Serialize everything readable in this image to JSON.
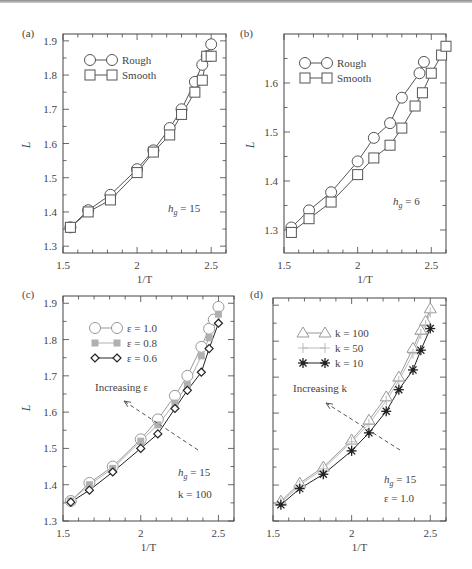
{
  "chart_data": [
    {
      "panel": "(a)",
      "type": "line",
      "xlabel": "1/T",
      "ylabel": "L",
      "xlim": [
        1.5,
        2.6
      ],
      "ylim": [
        1.28,
        1.92
      ],
      "xticks": [
        1.5,
        2,
        2.5
      ],
      "xtick_labels": [
        "1.5",
        "2",
        "2.5"
      ],
      "yticks": [
        1.3,
        1.4,
        1.5,
        1.6,
        1.7,
        1.8,
        1.9
      ],
      "ytick_labels": [
        "1.3",
        "1.4",
        "1.5",
        "1.6",
        "1.7",
        "1.8",
        "1.9"
      ],
      "legend_position": "upper left",
      "annotations": [
        {
          "text": "h_g = 15"
        }
      ],
      "series": [
        {
          "name": "Rough",
          "marker": "circle",
          "color": "#555555",
          "x": [
            1.55,
            1.67,
            1.82,
            2.0,
            2.11,
            2.22,
            2.3,
            2.39,
            2.44,
            2.47,
            2.5
          ],
          "y": [
            1.355,
            1.405,
            1.45,
            1.525,
            1.58,
            1.645,
            1.7,
            1.78,
            1.83,
            1.855,
            1.89
          ]
        },
        {
          "name": "Smooth",
          "marker": "square",
          "color": "#555555",
          "x": [
            1.55,
            1.67,
            1.82,
            2.0,
            2.11,
            2.22,
            2.3,
            2.39,
            2.44,
            2.47,
            2.5
          ],
          "y": [
            1.355,
            1.4,
            1.435,
            1.515,
            1.575,
            1.625,
            1.685,
            1.75,
            1.785,
            1.855,
            1.855
          ]
        }
      ]
    },
    {
      "panel": "(b)",
      "type": "line",
      "xlabel": "1/T",
      "ylabel": "L",
      "xlim": [
        1.5,
        2.6
      ],
      "ylim": [
        1.253,
        1.7
      ],
      "xticks": [
        1.5,
        2,
        2.5
      ],
      "xtick_labels": [
        "1.5",
        "2",
        "2.5"
      ],
      "yticks": [
        1.3,
        1.4,
        1.5,
        1.6
      ],
      "ytick_labels": [
        "1.3",
        "1.4",
        "1.5",
        "1.6"
      ],
      "legend_position": "upper left",
      "annotations": [
        {
          "text": "h_g = 6"
        }
      ],
      "series": [
        {
          "name": "Rough",
          "marker": "circle",
          "color": "#555555",
          "x": [
            1.55,
            1.67,
            1.82,
            2.0,
            2.11,
            2.22,
            2.3,
            2.42,
            2.45
          ],
          "y": [
            1.305,
            1.34,
            1.377,
            1.44,
            1.488,
            1.518,
            1.57,
            1.62,
            1.643
          ]
        },
        {
          "name": "Smooth",
          "marker": "square",
          "color": "#555555",
          "x": [
            1.55,
            1.67,
            1.82,
            2.0,
            2.11,
            2.22,
            2.3,
            2.39,
            2.44,
            2.5,
            2.57,
            2.6
          ],
          "y": [
            1.295,
            1.323,
            1.357,
            1.413,
            1.447,
            1.473,
            1.508,
            1.553,
            1.58,
            1.62,
            1.657,
            1.675
          ]
        }
      ]
    },
    {
      "panel": "(c)",
      "type": "line",
      "xlabel": "1/T",
      "ylabel": "L",
      "xlim": [
        1.5,
        2.6
      ],
      "ylim": [
        1.3,
        1.92
      ],
      "xticks": [
        1.5,
        2,
        2.5
      ],
      "xtick_labels": [
        "1.5",
        "2",
        "2.5"
      ],
      "yticks": [
        1.3,
        1.4,
        1.5,
        1.6,
        1.7,
        1.8,
        1.9
      ],
      "ytick_labels": [
        "1.3",
        "1.4",
        "1.5",
        "1.6",
        "1.7",
        "1.8",
        "1.9"
      ],
      "legend_position": "upper left",
      "annotations": [
        {
          "text": "Increasing ε",
          "arrow": true
        },
        {
          "text": "h_g = 15"
        },
        {
          "text": "k = 100"
        }
      ],
      "series": [
        {
          "name": "ε = 1.0",
          "marker": "circle",
          "color": "#999999",
          "x": [
            1.55,
            1.67,
            1.82,
            2.0,
            2.11,
            2.22,
            2.3,
            2.39,
            2.44,
            2.47,
            2.5
          ],
          "y": [
            1.355,
            1.405,
            1.45,
            1.525,
            1.58,
            1.645,
            1.7,
            1.78,
            1.83,
            1.855,
            1.89
          ]
        },
        {
          "name": "ε = 0.8",
          "marker": "filled-square",
          "color": "#b0b0b0",
          "x": [
            1.55,
            1.67,
            1.82,
            2.0,
            2.11,
            2.22,
            2.3,
            2.39,
            2.44,
            2.5
          ],
          "y": [
            1.355,
            1.4,
            1.445,
            1.52,
            1.565,
            1.625,
            1.675,
            1.755,
            1.805,
            1.87
          ]
        },
        {
          "name": "ε = 0.6",
          "marker": "diamond",
          "color": "#222222",
          "x": [
            1.55,
            1.67,
            1.82,
            2.0,
            2.11,
            2.22,
            2.3,
            2.39,
            2.44,
            2.5
          ],
          "y": [
            1.352,
            1.385,
            1.435,
            1.5,
            1.54,
            1.61,
            1.66,
            1.71,
            1.775,
            1.845
          ]
        }
      ]
    },
    {
      "panel": "(d)",
      "type": "line",
      "xlabel": "1/T",
      "ylabel": "",
      "xlim": [
        1.5,
        2.6
      ],
      "ylim": [
        1.3,
        1.92
      ],
      "xticks": [
        1.5,
        2,
        2.5
      ],
      "xtick_labels": [
        "1.5",
        "2",
        "2.5"
      ],
      "yticks": [
        1.3,
        1.4,
        1.5,
        1.6,
        1.7,
        1.8,
        1.9
      ],
      "ytick_labels": [],
      "legend_position": "upper left",
      "annotations": [
        {
          "text": "Increasing k",
          "arrow": true
        },
        {
          "text": "h_g = 15"
        },
        {
          "text": "ε = 1.0"
        }
      ],
      "series": [
        {
          "name": "k = 100",
          "marker": "triangle",
          "color": "#999999",
          "x": [
            1.55,
            1.67,
            1.82,
            2.0,
            2.11,
            2.22,
            2.3,
            2.39,
            2.44,
            2.47,
            2.5
          ],
          "y": [
            1.355,
            1.405,
            1.45,
            1.525,
            1.58,
            1.645,
            1.7,
            1.78,
            1.83,
            1.855,
            1.89
          ]
        },
        {
          "name": "k = 50",
          "marker": "plus",
          "color": "#bbbbbb",
          "x": [
            1.55,
            1.67,
            1.82,
            2.0,
            2.11,
            2.22,
            2.3,
            2.39,
            2.44,
            2.47,
            2.5
          ],
          "y": [
            1.35,
            1.4,
            1.445,
            1.52,
            1.57,
            1.635,
            1.69,
            1.765,
            1.82,
            1.845,
            1.88
          ]
        },
        {
          "name": "k = 10",
          "marker": "asterisk",
          "color": "#222222",
          "x": [
            1.55,
            1.67,
            1.82,
            2.0,
            2.11,
            2.22,
            2.3,
            2.39,
            2.44,
            2.5
          ],
          "y": [
            1.345,
            1.39,
            1.43,
            1.495,
            1.545,
            1.605,
            1.665,
            1.72,
            1.775,
            1.835
          ]
        }
      ]
    }
  ],
  "panels": [
    {
      "label": "(a)",
      "xlabel": "1/T",
      "ylabel": "L",
      "annotation": "h",
      "annotation_sub": "g",
      "annotation_rest": " = 15"
    },
    {
      "label": "(b)",
      "xlabel": "1/T",
      "ylabel": "L",
      "annotation": "h",
      "annotation_sub": "g",
      "annotation_rest": " = 6"
    },
    {
      "label": "(c)",
      "xlabel": "1/T",
      "ylabel": "L",
      "arrow_label": "Increasing ε",
      "annotation": "h",
      "annotation_sub": "g",
      "annotation_rest": " = 15",
      "annotation2": "k = 100"
    },
    {
      "label": "(d)",
      "xlabel": "1/T",
      "ylabel": "",
      "arrow_label": "Increasing k",
      "annotation": "h",
      "annotation_sub": "g",
      "annotation_rest": " = 15",
      "annotation2": "ε = 1.0"
    }
  ]
}
